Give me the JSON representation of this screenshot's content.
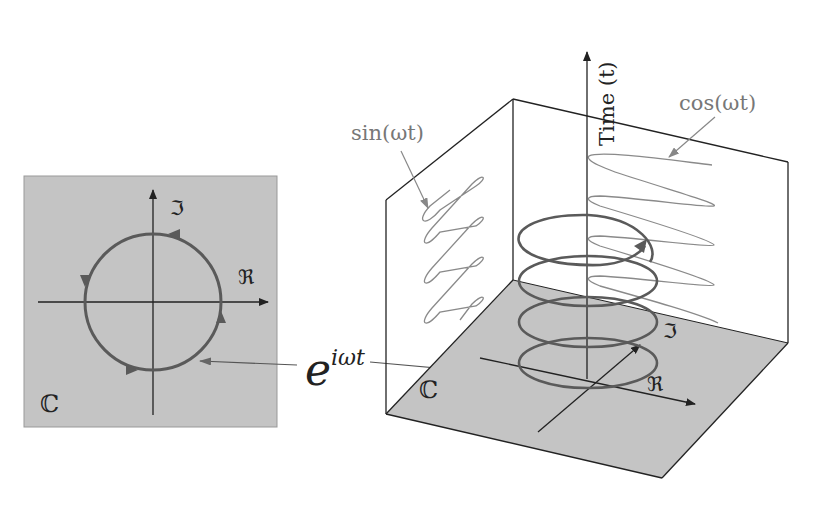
{
  "diagram": {
    "colors": {
      "plane_fill": "#c4c4c4",
      "curve": "#5a5a5a",
      "wave": "#8a8a8a",
      "edge": "#222222",
      "label_gray": "#777777"
    },
    "complex_plane_2d": {
      "set_label": "ℂ",
      "real_axis_label": "ℜ",
      "imag_axis_label": "ℑ",
      "curve": "unit circle, counter-clockwise",
      "direction_arrows": 4
    },
    "center_label": {
      "base": "e",
      "exponent": "iωt"
    },
    "complex_plane_3d": {
      "set_label": "ℂ",
      "real_axis_label": "ℜ",
      "imag_axis_label": "ℑ",
      "time_axis_label": "Time (t)",
      "helix_turns": 4,
      "sin_label": "sin(ωt)",
      "cos_label": "cos(ωt)",
      "sin_projection_wall": "left",
      "cos_projection_wall": "back"
    }
  }
}
